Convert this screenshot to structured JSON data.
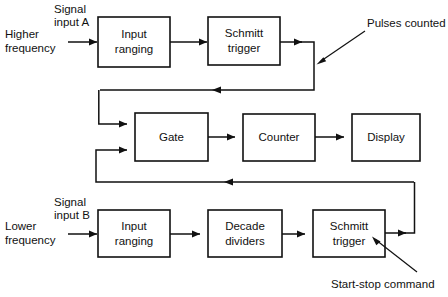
{
  "diagram": {
    "background_color": "#ffffff",
    "line_color": "#111111",
    "blocks": [
      {
        "id": "input-ranging-a",
        "label_line1": "Input",
        "label_line2": "ranging",
        "x": 98,
        "y": 17,
        "w": 72,
        "h": 50
      },
      {
        "id": "schmitt-trigger-a",
        "label_line1": "Schmitt",
        "label_line2": "trigger",
        "x": 208,
        "y": 17,
        "w": 72,
        "h": 48
      },
      {
        "id": "gate",
        "label_line1": "Gate",
        "label_line2": "",
        "x": 135,
        "y": 113,
        "w": 73,
        "h": 48
      },
      {
        "id": "counter",
        "label_line1": "Counter",
        "label_line2": "",
        "x": 243,
        "y": 114,
        "w": 72,
        "h": 47
      },
      {
        "id": "display",
        "label_line1": "Display",
        "label_line2": "",
        "x": 352,
        "y": 114,
        "w": 68,
        "h": 47
      },
      {
        "id": "input-ranging-b",
        "label_line1": "Input",
        "label_line2": "ranging",
        "x": 98,
        "y": 210,
        "w": 72,
        "h": 47
      },
      {
        "id": "decade-dividers",
        "label_line1": "Decade",
        "label_line2": "dividers",
        "x": 208,
        "y": 210,
        "w": 74,
        "h": 47
      },
      {
        "id": "schmitt-trigger-b",
        "label_line1": "Schmitt",
        "label_line2": "trigger",
        "x": 313,
        "y": 210,
        "w": 72,
        "h": 47
      }
    ],
    "labels": {
      "signal_input_a_line1": "Signal",
      "signal_input_a_line2": "input A",
      "higher_frequency_line1": "Higher",
      "higher_frequency_line2": "frequency",
      "pulses_counted": "Pulses counted",
      "signal_input_b_line1": "Signal",
      "signal_input_b_line2": "input B",
      "lower_frequency_line1": "Lower",
      "lower_frequency_line2": "frequency",
      "start_stop_command": "Start-stop command"
    }
  }
}
